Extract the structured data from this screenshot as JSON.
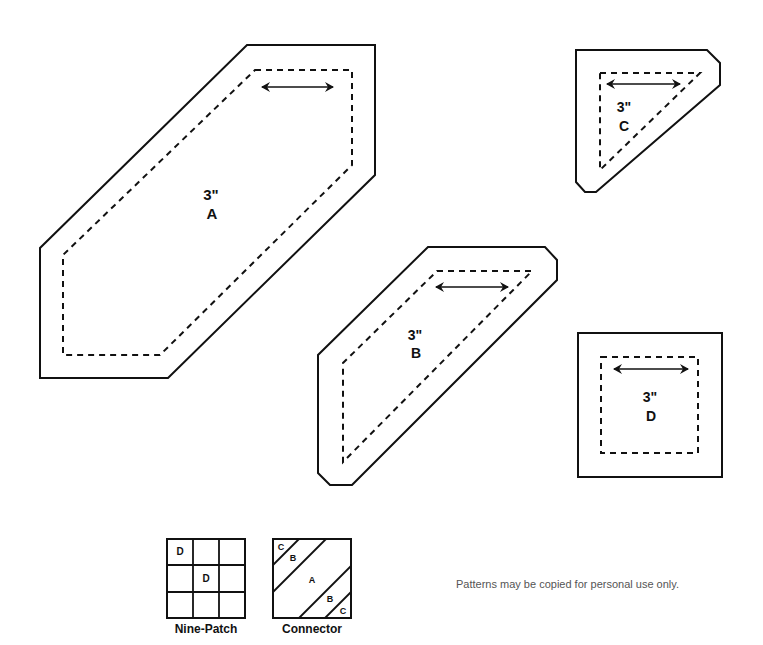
{
  "pieces": {
    "A": {
      "size": "3\"",
      "letter": "A"
    },
    "B": {
      "size": "3\"",
      "letter": "B"
    },
    "C": {
      "size": "3\"",
      "letter": "C"
    },
    "D": {
      "size": "3\"",
      "letter": "D"
    }
  },
  "diagrams": {
    "nine_patch": {
      "caption": "Nine-Patch",
      "cells": [
        "D",
        "",
        "",
        "",
        "D",
        "",
        "",
        "",
        ""
      ]
    },
    "connector": {
      "caption": "Connector",
      "labels": [
        "C",
        "B",
        "A",
        "B",
        "C"
      ]
    }
  },
  "footer": {
    "note": "Patterns may be copied for personal use only."
  },
  "colors": {
    "stroke": "#111111",
    "background": "#ffffff",
    "note_text": "#555555"
  }
}
